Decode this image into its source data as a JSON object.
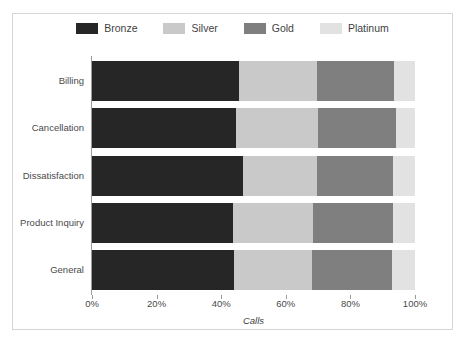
{
  "chart_data": {
    "type": "bar",
    "orientation": "horizontal",
    "stacked": true,
    "normalized": true,
    "title": "",
    "xlabel": "Calls",
    "ylabel": "",
    "xlim": [
      0,
      100
    ],
    "xticks": [
      "0%",
      "20%",
      "40%",
      "60%",
      "80%",
      "100%"
    ],
    "xtick_values": [
      0,
      20,
      40,
      60,
      80,
      100
    ],
    "grid": false,
    "legend_position": "top",
    "categories": [
      "Billing",
      "Cancellation",
      "Dissatisfaction",
      "Product Inquiry",
      "General"
    ],
    "series": [
      {
        "name": "Bronze",
        "color": "#262626",
        "values": [
          45.5,
          44.6,
          46.7,
          43.7,
          44.0
        ]
      },
      {
        "name": "Silver",
        "color": "#c9c9c9",
        "values": [
          24.2,
          25.4,
          23.0,
          24.7,
          24.0
        ]
      },
      {
        "name": "Gold",
        "color": "#7f7f7f",
        "values": [
          23.8,
          24.0,
          23.5,
          24.8,
          24.9
        ]
      },
      {
        "name": "Platinum",
        "color": "#e2e2e2",
        "values": [
          6.5,
          6.0,
          6.8,
          6.8,
          7.1
        ]
      }
    ]
  },
  "legend": {
    "items": [
      {
        "label": "Bronze",
        "color": "#262626"
      },
      {
        "label": "Silver",
        "color": "#c9c9c9"
      },
      {
        "label": "Gold",
        "color": "#7f7f7f"
      },
      {
        "label": "Platinum",
        "color": "#e2e2e2"
      }
    ]
  },
  "axis": {
    "x_title": "Calls",
    "x_tick_labels": [
      "0%",
      "20%",
      "40%",
      "60%",
      "80%",
      "100%"
    ],
    "y_tick_labels": [
      "Billing",
      "Cancellation",
      "Dissatisfaction",
      "Product Inquiry",
      "General"
    ]
  },
  "colors": {
    "frame": "#d6d6d6",
    "axis": "#9a9a9a",
    "text": "#4a4a4a",
    "background": "#ffffff"
  }
}
